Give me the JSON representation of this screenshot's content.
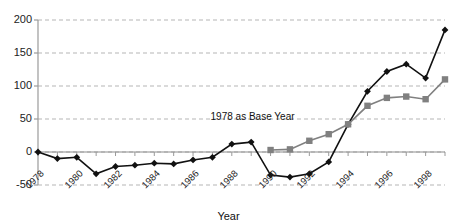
{
  "chart_data": {
    "type": "line",
    "title": "",
    "xlabel": "Year",
    "ylabel": "",
    "x": [
      1978,
      1979,
      1980,
      1981,
      1982,
      1983,
      1984,
      1985,
      1986,
      1987,
      1988,
      1989,
      1990,
      1991,
      1992,
      1993,
      1994,
      1995,
      1996,
      1997,
      1998,
      1999
    ],
    "xtick_labels": [
      "1978",
      "1980",
      "1982",
      "1984",
      "1986",
      "1988",
      "1990",
      "1992",
      "1994",
      "1996",
      "1998"
    ],
    "xtick_values": [
      1978,
      1980,
      1982,
      1984,
      1986,
      1988,
      1990,
      1992,
      1994,
      1996,
      1998
    ],
    "ytick_labels": [
      "200",
      "150",
      "100",
      "50",
      "0",
      "-50"
    ],
    "ytick_values": [
      200,
      150,
      100,
      50,
      0,
      -50
    ],
    "ylim": [
      -50,
      200
    ],
    "xlim": [
      1978,
      1999
    ],
    "grid": true,
    "legend": "none",
    "series": [
      {
        "name": "black-diamond-series",
        "marker": "diamond",
        "color": "#111111",
        "x": [
          1978,
          1979,
          1980,
          1981,
          1982,
          1983,
          1984,
          1985,
          1986,
          1987,
          1988,
          1989,
          1990,
          1991,
          1992,
          1993,
          1994,
          1995,
          1996,
          1997,
          1998,
          1999
        ],
        "values": [
          0,
          -10,
          -8,
          -33,
          -22,
          -20,
          -17,
          -18,
          -12,
          -8,
          12,
          15,
          -35,
          -38,
          -33,
          -15,
          42,
          92,
          122,
          133,
          112,
          185
        ]
      },
      {
        "name": "gray-square-series",
        "marker": "square",
        "color": "#808080",
        "x": [
          1990,
          1991,
          1992,
          1993,
          1994,
          1995,
          1996,
          1997,
          1998,
          1999
        ],
        "values": [
          3,
          4,
          17,
          27,
          42,
          70,
          82,
          84,
          80,
          110
        ]
      }
    ],
    "annotations": [
      {
        "text": "1978 as Base Year",
        "x": 1990,
        "y": 52
      }
    ]
  }
}
